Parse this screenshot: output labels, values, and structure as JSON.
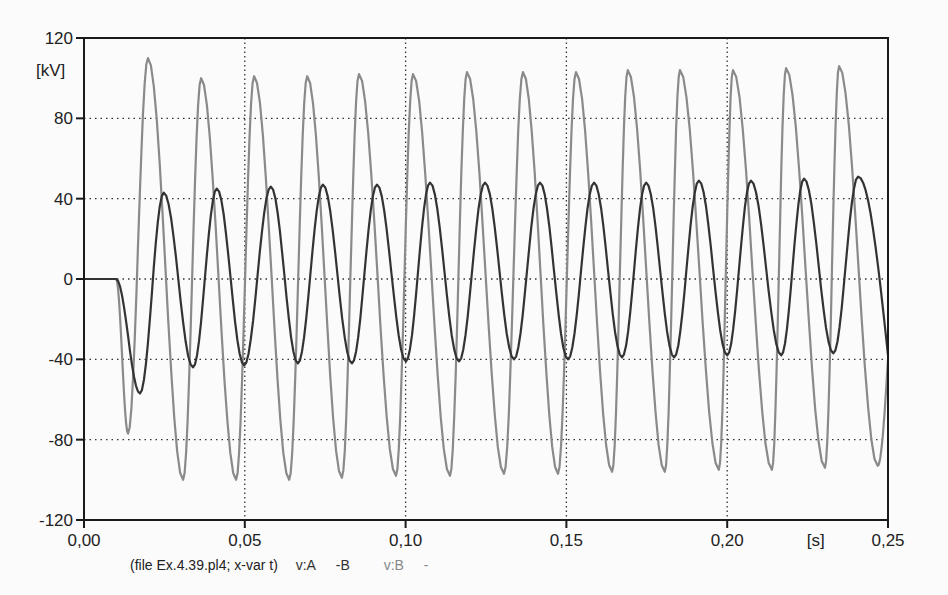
{
  "chart_data": {
    "type": "line",
    "title": "",
    "xlabel": "[s]",
    "ylabel": "[kV]",
    "xlim": [
      0.0,
      0.25
    ],
    "ylim": [
      -120,
      120
    ],
    "x_ticks": [
      "0,00",
      "0,05",
      "0,10",
      "0,15",
      "0,20",
      "0,25"
    ],
    "x_tick_values": [
      0.0,
      0.05,
      0.1,
      0.15,
      0.2,
      0.25
    ],
    "y_ticks": [
      "120",
      "80",
      "40",
      "0",
      "-40",
      "-80",
      "-120"
    ],
    "y_tick_values": [
      120,
      80,
      40,
      0,
      -40,
      -80,
      -120
    ],
    "grid": {
      "horizontal": [
        80,
        40,
        0,
        -40,
        -80
      ],
      "vertical": [
        0.05,
        0.1,
        0.15,
        0.2
      ],
      "style": "dotted"
    },
    "legend_position": "bottom",
    "series": [
      {
        "name": "v:A -B",
        "color": "#333333",
        "frequency_hz": 60,
        "start_t": 0.01,
        "steady_amplitude_kv": 45,
        "peaks": [
          {
            "t": 0.0248,
            "v": 43
          },
          {
            "t": 0.0413,
            "v": 45
          },
          {
            "t": 0.0581,
            "v": 46
          },
          {
            "t": 0.0743,
            "v": 47
          },
          {
            "t": 0.0911,
            "v": 47
          },
          {
            "t": 0.1076,
            "v": 48
          },
          {
            "t": 0.1247,
            "v": 48
          },
          {
            "t": 0.1418,
            "v": 48
          },
          {
            "t": 0.1586,
            "v": 48
          },
          {
            "t": 0.1748,
            "v": 48
          },
          {
            "t": 0.1912,
            "v": 49
          },
          {
            "t": 0.2074,
            "v": 49
          },
          {
            "t": 0.2239,
            "v": 50
          },
          {
            "t": 0.2407,
            "v": 51
          }
        ],
        "troughs": [
          {
            "t": 0.0174,
            "v": -57
          },
          {
            "t": 0.0339,
            "v": -44
          },
          {
            "t": 0.0498,
            "v": -43
          },
          {
            "t": 0.0665,
            "v": -42
          },
          {
            "t": 0.0833,
            "v": -42
          },
          {
            "t": 0.1001,
            "v": -41
          },
          {
            "t": 0.1166,
            "v": -41
          },
          {
            "t": 0.1337,
            "v": -40
          },
          {
            "t": 0.1505,
            "v": -40
          },
          {
            "t": 0.1673,
            "v": -39
          },
          {
            "t": 0.1835,
            "v": -39
          },
          {
            "t": 0.2,
            "v": -38
          },
          {
            "t": 0.2168,
            "v": -38
          },
          {
            "t": 0.233,
            "v": -37
          }
        ],
        "end_value_kv": -38
      },
      {
        "name": "v:B -",
        "color": "#8a8a8a",
        "frequency_hz": 60,
        "start_t": 0.01,
        "steady_amplitude_kv": 102,
        "peaks": [
          {
            "t": 0.0199,
            "v": 110
          },
          {
            "t": 0.0364,
            "v": 100
          },
          {
            "t": 0.0529,
            "v": 101
          },
          {
            "t": 0.0694,
            "v": 101
          },
          {
            "t": 0.0855,
            "v": 102
          },
          {
            "t": 0.1023,
            "v": 102
          },
          {
            "t": 0.1191,
            "v": 103
          },
          {
            "t": 0.1365,
            "v": 103
          },
          {
            "t": 0.153,
            "v": 103
          },
          {
            "t": 0.1691,
            "v": 104
          },
          {
            "t": 0.1853,
            "v": 104
          },
          {
            "t": 0.2018,
            "v": 104
          },
          {
            "t": 0.2183,
            "v": 105
          },
          {
            "t": 0.2348,
            "v": 106
          }
        ],
        "troughs": [
          {
            "t": 0.0137,
            "v": -77
          },
          {
            "t": 0.0308,
            "v": -100
          },
          {
            "t": 0.0473,
            "v": -100
          },
          {
            "t": 0.0638,
            "v": -100
          },
          {
            "t": 0.0802,
            "v": -99
          },
          {
            "t": 0.097,
            "v": -98
          },
          {
            "t": 0.1138,
            "v": -98
          },
          {
            "t": 0.1306,
            "v": -97
          },
          {
            "t": 0.1474,
            "v": -97
          },
          {
            "t": 0.1642,
            "v": -96
          },
          {
            "t": 0.1806,
            "v": -96
          },
          {
            "t": 0.1974,
            "v": -95
          },
          {
            "t": 0.2139,
            "v": -95
          },
          {
            "t": 0.2304,
            "v": -94
          },
          {
            "t": 0.2468,
            "v": -93
          }
        ],
        "end_value_kv": -40
      }
    ]
  },
  "axes": {
    "y_unit": "[kV]",
    "x_unit": "[s]"
  },
  "legend": {
    "file_text": "(file Ex.4.39.pl4; x-var t)",
    "series_a": "v:A",
    "series_a_suffix": "-B",
    "series_b": "v:B",
    "series_b_suffix": "-"
  }
}
